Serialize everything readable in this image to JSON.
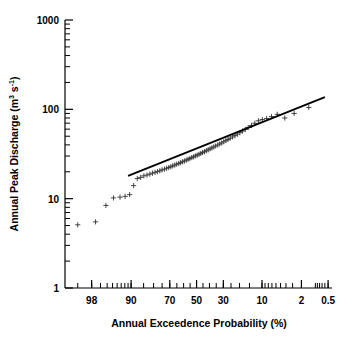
{
  "chart_data": {
    "type": "scatter",
    "title": "",
    "xlabel": "Annual Exceedence Probability (%)",
    "ylabel_text": "Annual Peak Discharge (m",
    "ylabel_sup1": "3",
    "ylabel_mid": " s",
    "ylabel_sup2": "-1",
    "ylabel_end": ")",
    "ylabel": "Annual Peak Discharge (m3 s-1)",
    "yscale": "log",
    "xscale": "probability",
    "ylim": [
      1,
      1000
    ],
    "xlim": [
      99.5,
      0.4
    ],
    "grid": false,
    "legend": null,
    "ytick_labels": [
      "1000",
      "100",
      "10",
      "1"
    ],
    "ytick_values": [
      1000,
      100,
      10,
      1
    ],
    "xtick_labels": [
      "98",
      "90",
      "70",
      "50",
      "30",
      "10",
      "2",
      "0.5"
    ],
    "xtick_values": [
      98,
      90,
      70,
      50,
      30,
      10,
      2,
      0.5
    ],
    "marker": "plus",
    "marker_color": "#333333",
    "line_color": "#000000",
    "fit_line": {
      "label": "fitted frequency curve",
      "x_start": 91.0,
      "y_start": 18.0,
      "x_end": 0.6,
      "y_end": 137.0
    },
    "series": [
      {
        "name": "Annual peak discharge",
        "x": [
          99.0,
          97.6,
          96.2,
          94.8,
          93.3,
          91.9,
          90.5,
          89.1,
          87.7,
          86.3,
          84.9,
          83.4,
          82.0,
          80.6,
          79.2,
          77.8,
          76.4,
          75.0,
          73.5,
          72.1,
          70.7,
          69.3,
          67.9,
          66.5,
          65.1,
          63.6,
          62.2,
          60.8,
          59.4,
          58.0,
          56.6,
          55.2,
          53.7,
          52.3,
          50.9,
          49.5,
          48.1,
          46.7,
          45.3,
          43.8,
          42.4,
          41.0,
          39.6,
          38.2,
          36.8,
          35.4,
          33.9,
          32.5,
          31.1,
          29.7,
          28.3,
          26.9,
          25.5,
          24.0,
          22.6,
          21.2,
          19.8,
          18.4,
          17.0,
          15.6,
          14.1,
          12.7,
          11.3,
          9.9,
          8.5,
          7.1,
          5.7,
          4.2,
          2.8,
          1.4
        ],
        "y": [
          5.1,
          5.5,
          8.4,
          10.2,
          10.4,
          10.6,
          11.1,
          14.0,
          16.8,
          17.3,
          18.0,
          18.4,
          18.8,
          19.3,
          19.7,
          20.1,
          20.5,
          21.0,
          21.4,
          21.9,
          22.3,
          22.8,
          23.3,
          23.8,
          24.3,
          24.8,
          25.3,
          25.9,
          26.4,
          27.0,
          27.6,
          28.2,
          28.8,
          29.4,
          30.1,
          30.7,
          31.4,
          32.1,
          32.9,
          33.6,
          34.4,
          35.2,
          36.1,
          37.0,
          37.9,
          38.9,
          39.9,
          41.0,
          42.1,
          43.3,
          44.6,
          46.0,
          47.5,
          49.1,
          50.8,
          52.7,
          54.8,
          57.1,
          59.7,
          62.6,
          66.0,
          69.8,
          74.4,
          77.0,
          79.0,
          83.0,
          88.0,
          80.0,
          90.0,
          105.0
        ]
      }
    ]
  },
  "axes": {
    "x_axis_name": "x-axis",
    "y_axis_name": "y-axis"
  }
}
